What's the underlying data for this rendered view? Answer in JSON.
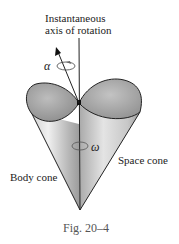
{
  "figure": {
    "axis_label_line1": "Instantaneous",
    "axis_label_line2": "axis of rotation",
    "alpha_symbol": "α",
    "omega_symbol": "ω",
    "space_cone_label": "Space cone",
    "body_cone_label": "Body cone",
    "caption": "Fig. 20–4"
  },
  "colors": {
    "cone_fill_light": "#e6e6e6",
    "cone_fill_mid": "#b8b8b8",
    "cone_fill_dark": "#8e8e8e",
    "top_face": "#9c9c9c",
    "outline": "#222222"
  }
}
